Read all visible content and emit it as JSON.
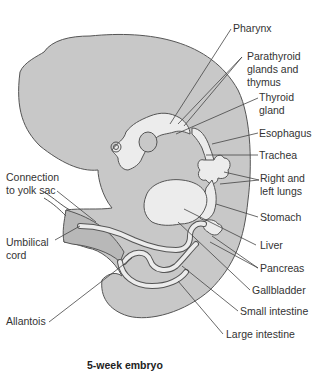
{
  "figure": {
    "caption": "5-week embryo",
    "colors": {
      "background": "#ffffff",
      "body_fill": "#c8c8c8",
      "organ_fill": "#ececec",
      "outline": "#555555",
      "leader_line": "#444444",
      "text": "#333333"
    }
  },
  "labels": {
    "pharynx": "Pharynx",
    "parathyroid": "Parathyroid\nglands and\nthymus",
    "thyroid": "Thyroid\ngland",
    "esophagus": "Esophagus",
    "trachea": "Trachea",
    "lungs": "Right and\nleft lungs",
    "stomach": "Stomach",
    "liver": "Liver",
    "pancreas": "Pancreas",
    "gallbladder": "Gallbladder",
    "small_intestine": "Small intestine",
    "large_intestine": "Large intestine",
    "yolk_sac": "Connection\nto yolk sac",
    "umbilical": "Umbilical\ncord",
    "allantois": "Allantois"
  }
}
